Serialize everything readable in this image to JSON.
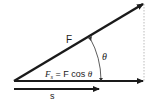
{
  "diagram": {
    "type": "vector-decomposition",
    "labels": {
      "force": "F",
      "angle": "θ",
      "component_F": "F",
      "component_sub": "s",
      "component_eq": " = F cos ",
      "component_theta": "θ",
      "displacement": "s"
    },
    "colors": {
      "arrow": "#1a1a1a",
      "dotted": "#aaaaaa",
      "text": "#222222"
    },
    "geometry": {
      "origin": [
        14,
        81
      ],
      "force_tip": [
        145,
        3
      ],
      "component_tip": [
        145,
        81
      ],
      "displacement_tip": [
        101,
        89
      ]
    }
  }
}
